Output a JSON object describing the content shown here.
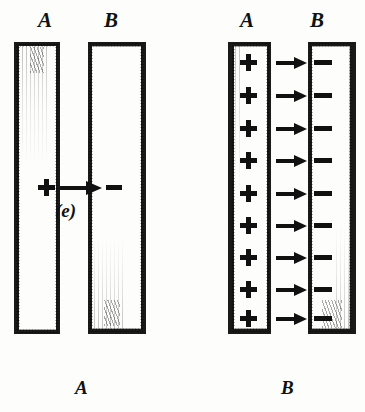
{
  "figure": {
    "caption_label": "(e)",
    "top_labels": [
      {
        "text": "A",
        "x": 38,
        "y": 10
      },
      {
        "text": "B",
        "x": 104,
        "y": 10
      },
      {
        "text": "A",
        "x": 240,
        "y": 10
      },
      {
        "text": "B",
        "x": 310,
        "y": 10
      }
    ],
    "bottom_labels": [
      {
        "text": "A",
        "x": 75,
        "y": 378
      },
      {
        "text": "B",
        "x": 281,
        "y": 378
      }
    ],
    "panels": [
      {
        "name": "panel-left",
        "id": "e",
        "plate_a": {
          "x": 14,
          "y": 42,
          "w": 46,
          "h": 292,
          "label": "A"
        },
        "plate_b": {
          "x": 88,
          "y": 42,
          "w": 58,
          "h": 292,
          "label": "B"
        },
        "rows": [
          {
            "plus": "+",
            "arrow": "→",
            "minus": "−",
            "y": 186
          }
        ],
        "row_count": 1
      },
      {
        "name": "panel-right",
        "id": "f",
        "plate_a": {
          "x": 228,
          "y": 42,
          "w": 43,
          "h": 292,
          "label": "A"
        },
        "plate_b": {
          "x": 308,
          "y": 42,
          "w": 48,
          "h": 292,
          "label": "B"
        },
        "rows": [
          {
            "plus": "+",
            "arrow": "→",
            "minus": "−",
            "y": 62
          },
          {
            "plus": "+",
            "arrow": "→",
            "minus": "−",
            "y": 95
          },
          {
            "plus": "+",
            "arrow": "→",
            "minus": "−",
            "y": 128
          },
          {
            "plus": "+",
            "arrow": "→",
            "minus": "−",
            "y": 160
          },
          {
            "plus": "+",
            "arrow": "→",
            "minus": "−",
            "y": 193
          },
          {
            "plus": "+",
            "arrow": "→",
            "minus": "−",
            "y": 225
          },
          {
            "plus": "+",
            "arrow": "→",
            "minus": "−",
            "y": 257
          },
          {
            "plus": "+",
            "arrow": "→",
            "minus": "−",
            "y": 289
          },
          {
            "plus": "+",
            "arrow": "→",
            "minus": "−",
            "y": 318
          }
        ],
        "row_count": 9
      }
    ],
    "colors": {
      "ink": "#1a1a1a",
      "paper": "#fdfdfb"
    }
  }
}
